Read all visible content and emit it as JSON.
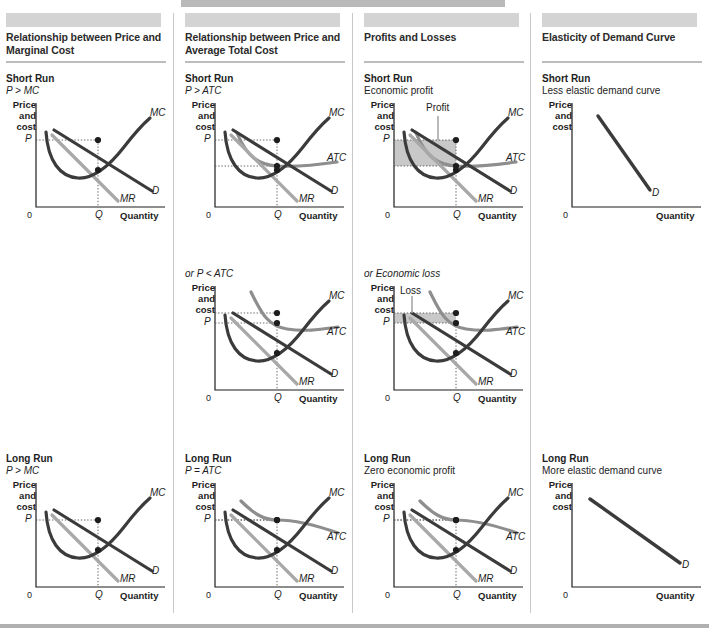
{
  "figure": {
    "bottom_rule_color": "#b0b0b0",
    "top_banner_color": "#b9b9b9"
  },
  "palette": {
    "curve_dark": "#3b3b3b",
    "curve_gray": "#a8a8a8",
    "curve_midgray": "#8e8e8e",
    "shade_fill": "#b6b6b6",
    "axis": "#1d1d1d",
    "header_bar": "#d4d4d4",
    "rule": "#bdbdbd"
  },
  "axes": {
    "y_label": "Price\nand\ncost",
    "y_label_lines": [
      "Price",
      "and",
      "cost"
    ],
    "origin": "0",
    "x_label": "Quantity",
    "price_tick": "P",
    "quantity_tick": "Q"
  },
  "curve_labels": {
    "mc": "MC",
    "atc": "ATC",
    "d": "D",
    "mr": "MR"
  },
  "columns": [
    {
      "id": "price-marginal-cost",
      "title": "Relationship between Price and Marginal Cost",
      "sections": [
        {
          "id": "short-run",
          "run": "Short Run",
          "sub": "P > MC",
          "sub_italic": true,
          "graph": "mc-only",
          "shade": "none",
          "shade_label": ""
        },
        {
          "id": "long-run",
          "run": "Long Run",
          "sub": "P > MC",
          "sub_italic": true,
          "graph": "mc-only",
          "shade": "none",
          "shade_label": ""
        }
      ]
    },
    {
      "id": "price-average-total-cost",
      "title": "Relationship between Price and Average Total Cost",
      "sections": [
        {
          "id": "short-run",
          "run": "Short Run",
          "sub": "P > ATC",
          "sub_italic": true,
          "graph": "atc-low",
          "shade": "none",
          "shade_label": ""
        },
        {
          "id": "or-short-run",
          "run": "",
          "sub": "or P < ATC",
          "sub_italic": true,
          "graph": "atc-high",
          "shade": "none",
          "shade_label": ""
        },
        {
          "id": "long-run",
          "run": "Long Run",
          "sub": "P = ATC",
          "sub_italic": true,
          "graph": "atc-tangent",
          "shade": "none",
          "shade_label": ""
        }
      ]
    },
    {
      "id": "profits-and-losses",
      "title": "Profits and Losses",
      "sections": [
        {
          "id": "short-run",
          "run": "Short Run",
          "sub": "Economic profit",
          "sub_italic": false,
          "graph": "atc-low",
          "shade": "profit",
          "shade_label": "Profit"
        },
        {
          "id": "or-short-run",
          "run": "",
          "sub": "or Economic loss",
          "sub_italic": true,
          "graph": "atc-high",
          "shade": "loss",
          "shade_label": "Loss"
        },
        {
          "id": "long-run",
          "run": "Long Run",
          "sub": "Zero economic profit",
          "sub_italic": false,
          "graph": "atc-tangent",
          "shade": "none",
          "shade_label": ""
        }
      ]
    },
    {
      "id": "elasticity-of-demand-curve",
      "title": "Elasticity of Demand Curve",
      "sections": [
        {
          "id": "short-run",
          "run": "Short Run",
          "sub": "Less elastic demand curve",
          "sub_italic": false,
          "graph": "demand-steep",
          "shade": "none",
          "shade_label": ""
        },
        {
          "id": "long-run",
          "run": "Long Run",
          "sub": "More elastic demand curve",
          "sub_italic": false,
          "graph": "demand-flat",
          "shade": "none",
          "shade_label": ""
        }
      ]
    }
  ],
  "chart_data": {
    "type": "line",
    "xlabel": "Quantity",
    "ylabel": "Price and cost",
    "axis_ticks": {
      "x": [
        "0",
        "Q"
      ],
      "y": [
        "P"
      ]
    },
    "grid": false,
    "legend": "inline curve labels",
    "series_definitions": [
      {
        "name": "MC",
        "role": "marginal cost",
        "shape": "U-shaped, minimum near Q, rising steeply to the right",
        "color": "#3b3b3b"
      },
      {
        "name": "ATC",
        "role": "average total cost",
        "shape": "U-shaped, flatter and above MC minimum",
        "color": "#8e8e8e"
      },
      {
        "name": "D",
        "role": "demand",
        "shape": "downward sloping straight line",
        "color": "#3b3b3b"
      },
      {
        "name": "MR",
        "role": "marginal revenue",
        "shape": "downward sloping straight line, twice the slope of D",
        "color": "#a8a8a8"
      }
    ],
    "equilibrium_rule": "Output Q where MR = MC; price P read off the demand curve at Q",
    "panels": [
      {
        "column": "Relationship between Price and Marginal Cost",
        "row": "Short Run",
        "relation": "P > MC"
      },
      {
        "column": "Relationship between Price and Marginal Cost",
        "row": "Long Run",
        "relation": "P > MC"
      },
      {
        "column": "Relationship between Price and Average Total Cost",
        "row": "Short Run",
        "relation": "P > ATC"
      },
      {
        "column": "Relationship between Price and Average Total Cost",
        "row": "or",
        "relation": "P < ATC"
      },
      {
        "column": "Relationship between Price and Average Total Cost",
        "row": "Long Run",
        "relation": "P = ATC"
      },
      {
        "column": "Profits and Losses",
        "row": "Short Run",
        "relation": "Economic profit",
        "shaded_area": "Profit"
      },
      {
        "column": "Profits and Losses",
        "row": "or",
        "relation": "Economic loss",
        "shaded_area": "Loss"
      },
      {
        "column": "Profits and Losses",
        "row": "Long Run",
        "relation": "Zero economic profit"
      },
      {
        "column": "Elasticity of Demand Curve",
        "row": "Short Run",
        "relation": "Less elastic demand curve"
      },
      {
        "column": "Elasticity of Demand Curve",
        "row": "Long Run",
        "relation": "More elastic demand curve"
      }
    ]
  }
}
